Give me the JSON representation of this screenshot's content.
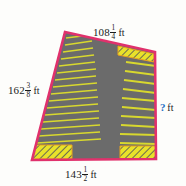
{
  "figure": {
    "shape_name": "quadrilateral-parking-lot",
    "surface_color": "#6b6b6b",
    "border_color": "#e0316c",
    "stripe_color": "#d8d82e",
    "hatch_color": "#e8e22a",
    "unknown_color": "#1f6fc4",
    "background_color": "#fdfdfb"
  },
  "dimensions": {
    "top": {
      "whole": "108",
      "numerator": "1",
      "denominator": "4",
      "unit": "ft",
      "value": 108.25,
      "side": "top"
    },
    "left": {
      "whole": "162",
      "numerator": "3",
      "denominator": "8",
      "unit": "ft",
      "value": 162.375,
      "side": "left"
    },
    "bottom": {
      "whole": "143",
      "numerator": "1",
      "denominator": "2",
      "unit": "ft",
      "value": 143.5,
      "side": "bottom"
    },
    "right": {
      "whole": "?",
      "numerator": "",
      "denominator": "",
      "unit": "ft",
      "value": null,
      "side": "right",
      "unknown": true
    }
  },
  "geometry": {
    "vertices": {
      "top_left": [
        65,
        32
      ],
      "top_right": [
        155,
        52
      ],
      "bottom_right": [
        156,
        159
      ],
      "bottom_left": [
        32,
        160
      ]
    },
    "left_stalls_count": 16,
    "right_stalls_count": 11,
    "hatched_corners": [
      "top-right",
      "bottom-left",
      "bottom-right"
    ]
  }
}
